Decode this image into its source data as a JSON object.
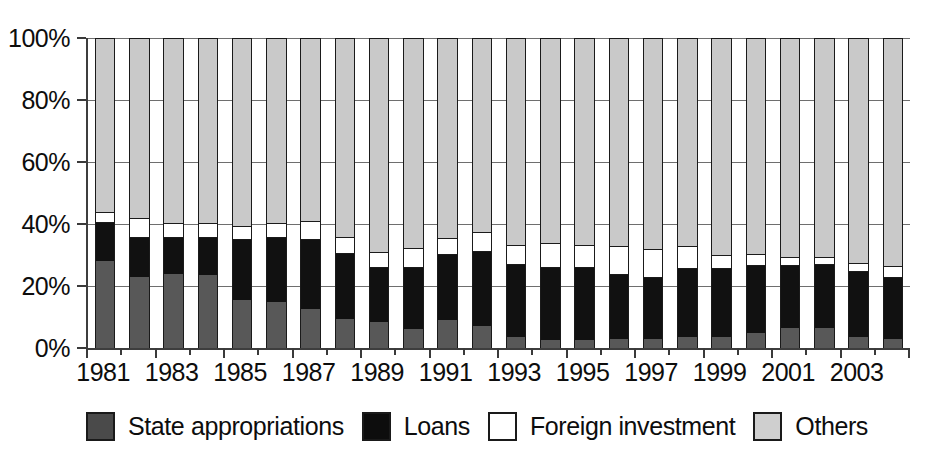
{
  "chart_data": {
    "type": "bar",
    "stacked": true,
    "stack_mode": "percent",
    "title": "",
    "subtitle": "",
    "xlabel": "",
    "ylabel": "",
    "ylim": [
      0,
      100
    ],
    "grid": true,
    "legend_position": "bottom",
    "y_tick_labels": [
      "100%",
      "80%",
      "60%",
      "40%",
      "20%",
      "0%"
    ],
    "y_tick_values": [
      100,
      80,
      60,
      40,
      20,
      0
    ],
    "categories": [
      "1981",
      "1982",
      "1983",
      "1984",
      "1985",
      "1986",
      "1987",
      "1988",
      "1989",
      "1990",
      "1991",
      "1992",
      "1993",
      "1994",
      "1995",
      "1996",
      "1997",
      "1998",
      "1999",
      "2000",
      "2001",
      "2002",
      "2003",
      "2004"
    ],
    "x_tick_labels": [
      "1981",
      "1983",
      "1985",
      "1987",
      "1989",
      "1991",
      "1993",
      "1995",
      "1997",
      "1999",
      "2001",
      "2003"
    ],
    "series": [
      {
        "name": "State appropriations",
        "color": "#585858",
        "values": [
          28,
          23,
          24,
          23.5,
          15.5,
          15,
          12.5,
          9.5,
          8.5,
          6,
          9,
          7,
          3.5,
          2.5,
          2.5,
          3,
          3,
          3.5,
          3.5,
          5,
          6.5,
          6.5,
          3.5,
          3
        ]
      },
      {
        "name": "Loans",
        "color": "#111111",
        "values": [
          12.5,
          12.5,
          11.5,
          12,
          19.5,
          20.5,
          22.5,
          21,
          17.5,
          20,
          21,
          24,
          23.5,
          23.5,
          23.5,
          20.5,
          19.5,
          22,
          22,
          21.5,
          20,
          20.5,
          21,
          19.5
        ]
      },
      {
        "name": "Foreign investment",
        "color": "#ffffff",
        "values": [
          3.5,
          6.5,
          5,
          5,
          4.5,
          5,
          6,
          5.5,
          5,
          6.5,
          5.5,
          6.5,
          6.5,
          8,
          7.5,
          9.5,
          9.5,
          7.5,
          4.5,
          4,
          3,
          2.5,
          3,
          4
        ]
      },
      {
        "name": "Others",
        "color": "#c9c9c9",
        "values": [
          56,
          58,
          59.5,
          59.5,
          60.5,
          59.5,
          59,
          64,
          69,
          67.5,
          64.5,
          62.5,
          66.5,
          66,
          66.5,
          67,
          68,
          67,
          70,
          69.5,
          70.5,
          70.5,
          72.5,
          73.5
        ]
      }
    ],
    "legend": [
      {
        "label": "State appropriations",
        "swatch": "dark-gray"
      },
      {
        "label": "Loans",
        "swatch": "black"
      },
      {
        "label": "Foreign investment",
        "swatch": "white"
      },
      {
        "label": "Others",
        "swatch": "light-gray"
      }
    ]
  }
}
